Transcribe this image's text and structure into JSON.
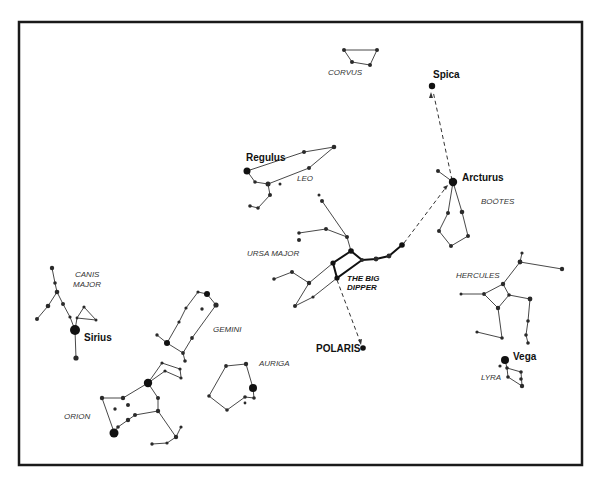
{
  "diagram": {
    "colors": {
      "ink": "#111111",
      "lines": "#333333",
      "background": "#ffffff"
    },
    "star_labels": {
      "spica": "Spica",
      "regulus": "Regulus",
      "arcturus": "Arcturus",
      "sirius": "Sirius",
      "polaris": "POLARIS",
      "vega": "Vega"
    },
    "constellation_labels": {
      "corvus": "CORVUS",
      "leo": "LEO",
      "bootes": "BOÖTES",
      "ursa_major": "URSA MAJOR",
      "big_dipper_line1": "THE BIG",
      "big_dipper_line2": "DIPPER",
      "canis_major_line1": "CANIS",
      "canis_major_line2": "MAJOR",
      "hercules": "HERCULES",
      "gemini": "GEMINI",
      "auriga": "AURIGA",
      "lyra": "LYRA",
      "orion": "ORION"
    },
    "pointer_lines": [
      {
        "from": "The Big Dipper",
        "to": "Polaris",
        "style": "dashed"
      },
      {
        "from": "The Big Dipper handle",
        "to": "Arcturus",
        "style": "dashed"
      },
      {
        "from": "Arcturus",
        "to": "Spica",
        "style": "dashed"
      }
    ]
  }
}
